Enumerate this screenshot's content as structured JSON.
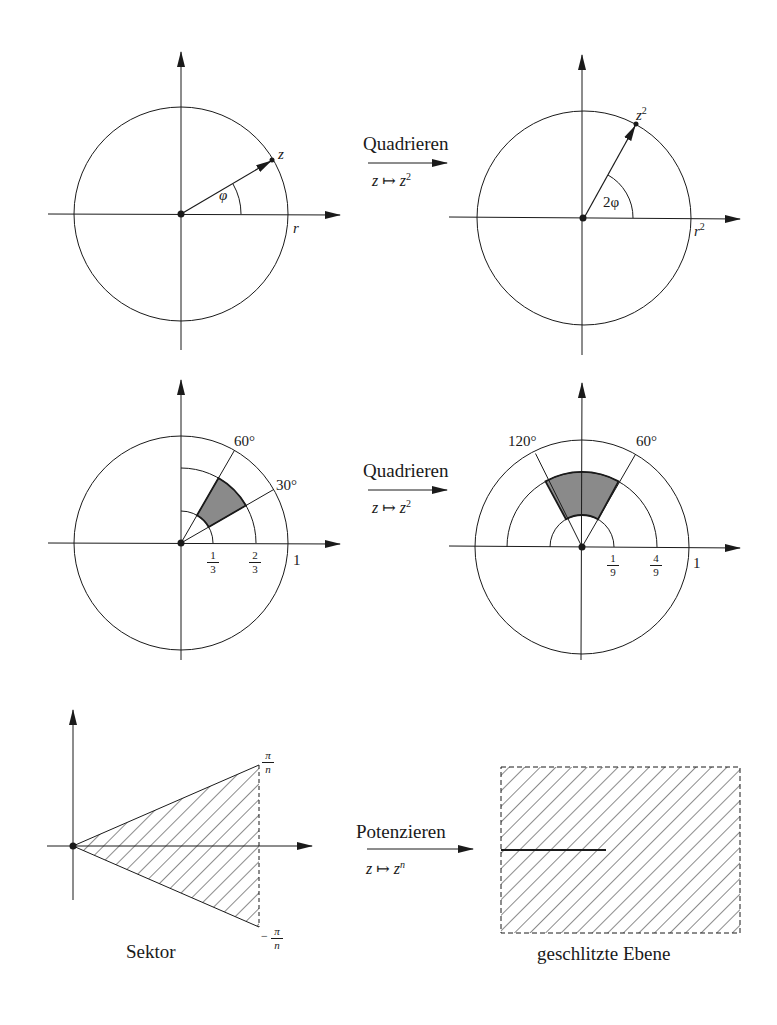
{
  "row1": {
    "left": {
      "point_label": "z",
      "angle_label": "φ",
      "radius_label": "r"
    },
    "arrow": {
      "title": "Quadrieren",
      "mapping_lhs": "z",
      "mapping_sym": "↦",
      "mapping_rhs": "z",
      "mapping_exp": "2"
    },
    "right": {
      "point_label": "z",
      "point_exp": "2",
      "angle_label": "2φ",
      "radius_label": "r",
      "radius_exp": "2"
    }
  },
  "row2": {
    "left": {
      "angle_a": "60°",
      "angle_b": "30°",
      "tick1_num": "1",
      "tick1_den": "3",
      "tick2_num": "2",
      "tick2_den": "3",
      "radius_label": "1"
    },
    "arrow": {
      "title": "Quadrieren",
      "mapping_lhs": "z",
      "mapping_sym": "↦",
      "mapping_rhs": "z",
      "mapping_exp": "2"
    },
    "right": {
      "angle_a": "120°",
      "angle_b": "60°",
      "tick1_num": "1",
      "tick1_den": "9",
      "tick2_num": "4",
      "tick2_den": "9",
      "radius_label": "1"
    }
  },
  "row3": {
    "left": {
      "top_num": "π",
      "top_den": "n",
      "bottom_sign": "−",
      "bottom_num": "π",
      "bottom_den": "n",
      "caption": "Sektor"
    },
    "arrow": {
      "title": "Potenzieren",
      "mapping_lhs": "z",
      "mapping_sym": "↦",
      "mapping_rhs": "z",
      "mapping_exp": "n"
    },
    "right": {
      "caption": "geschlitzte Ebene"
    }
  },
  "colors": {
    "ink": "#1a1a1a",
    "shade": "#8a8a8a",
    "background": "#ffffff"
  }
}
